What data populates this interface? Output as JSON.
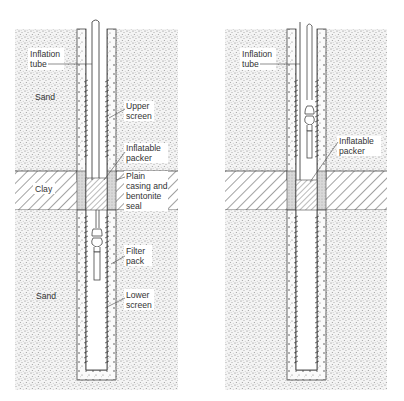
{
  "figure": {
    "left_panel": {
      "labels": {
        "inflation_tube": [
          "Inflation",
          "tube"
        ],
        "sand_top": "Sand",
        "upper_screen": [
          "Upper",
          "screen"
        ],
        "inflatable_packer": [
          "Inflatable",
          "packer"
        ],
        "clay": "Clay",
        "plain_casing": [
          "Plain",
          "casing and",
          "bentonite",
          "seal"
        ],
        "filter_pack": [
          "Filter",
          "pack"
        ],
        "sand_bottom": "Sand",
        "lower_screen": [
          "Lower",
          "screen"
        ]
      }
    },
    "right_panel": {
      "labels": {
        "inflation_tube": [
          "Inflation",
          "tube"
        ],
        "inflatable_packer": [
          "Inflatable",
          "packer"
        ]
      }
    },
    "colors": {
      "line": "#444444",
      "sand_dots": "#8a8a8a",
      "background": "#ffffff"
    }
  }
}
